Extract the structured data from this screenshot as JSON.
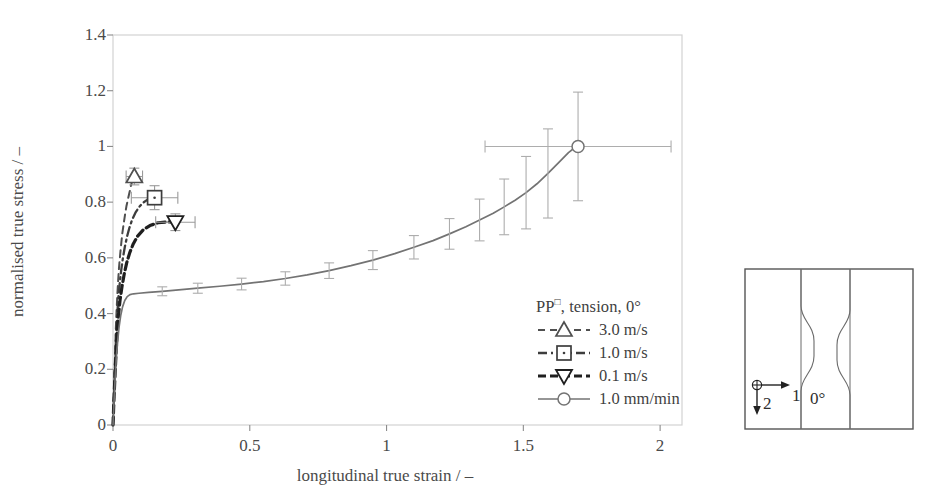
{
  "chart_data": {
    "type": "line",
    "title": "",
    "xlabel": "longitudinal true strain / –",
    "ylabel": "normalised true stress / –",
    "xlim": [
      0,
      2.08
    ],
    "ylim": [
      0,
      1.4
    ],
    "xticks": [
      "0",
      "0.5",
      "1",
      "1.5",
      "2"
    ],
    "xtick_values": [
      0,
      0.5,
      1,
      1.5,
      2
    ],
    "yticks": [
      "0",
      "0.2",
      "0.4",
      "0.6",
      "0.8",
      "1",
      "1.2",
      "1.4"
    ],
    "ytick_values": [
      0,
      0.2,
      0.4,
      0.6,
      0.8,
      1.0,
      1.2,
      1.4
    ],
    "grid": false,
    "legend_position": "inside-lower-right",
    "legend_title": "PP□, tension, 0°",
    "series": [
      {
        "name": "3.0 m/s",
        "marker": "triangle-up",
        "linestyle": "dashed",
        "color": "#4f4f4f",
        "points": [
          [
            0.0,
            0.0
          ],
          [
            0.003,
            0.09
          ],
          [
            0.005,
            0.175
          ],
          [
            0.008,
            0.265
          ],
          [
            0.01,
            0.34
          ],
          [
            0.013,
            0.41
          ],
          [
            0.016,
            0.47
          ],
          [
            0.019,
            0.52
          ],
          [
            0.022,
            0.565
          ],
          [
            0.026,
            0.61
          ],
          [
            0.03,
            0.65
          ],
          [
            0.034,
            0.688
          ],
          [
            0.039,
            0.722
          ],
          [
            0.044,
            0.755
          ],
          [
            0.049,
            0.785
          ],
          [
            0.055,
            0.812
          ],
          [
            0.061,
            0.838
          ],
          [
            0.066,
            0.86
          ],
          [
            0.07,
            0.876
          ],
          [
            0.074,
            0.886
          ],
          [
            0.078,
            0.892
          ]
        ],
        "end_marker": [
          0.078,
          0.892
        ],
        "end_xerr": 0.03,
        "end_yerr": 0.03
      },
      {
        "name": "1.0 m/s",
        "marker": "square",
        "linestyle": "dashdot",
        "color": "#3d3d3d",
        "points": [
          [
            0.0,
            0.0
          ],
          [
            0.003,
            0.085
          ],
          [
            0.006,
            0.175
          ],
          [
            0.009,
            0.262
          ],
          [
            0.012,
            0.338
          ],
          [
            0.016,
            0.405
          ],
          [
            0.02,
            0.462
          ],
          [
            0.025,
            0.512
          ],
          [
            0.03,
            0.556
          ],
          [
            0.036,
            0.598
          ],
          [
            0.043,
            0.638
          ],
          [
            0.051,
            0.675
          ],
          [
            0.06,
            0.708
          ],
          [
            0.07,
            0.737
          ],
          [
            0.082,
            0.762
          ],
          [
            0.095,
            0.782
          ],
          [
            0.11,
            0.798
          ],
          [
            0.125,
            0.808
          ],
          [
            0.14,
            0.814
          ],
          [
            0.152,
            0.816
          ]
        ],
        "end_marker": [
          0.152,
          0.816
        ],
        "end_xerr": 0.085,
        "end_yerr": 0.043
      },
      {
        "name": "0.1 m/s",
        "marker": "triangle-down",
        "linestyle": "dashed-bold",
        "color": "#1f1f1f",
        "points": [
          [
            0.0,
            0.0
          ],
          [
            0.003,
            0.08
          ],
          [
            0.007,
            0.17
          ],
          [
            0.011,
            0.256
          ],
          [
            0.015,
            0.33
          ],
          [
            0.02,
            0.394
          ],
          [
            0.026,
            0.45
          ],
          [
            0.033,
            0.498
          ],
          [
            0.041,
            0.542
          ],
          [
            0.05,
            0.582
          ],
          [
            0.061,
            0.618
          ],
          [
            0.074,
            0.65
          ],
          [
            0.09,
            0.678
          ],
          [
            0.11,
            0.7
          ],
          [
            0.135,
            0.716
          ],
          [
            0.165,
            0.726
          ],
          [
            0.2,
            0.729
          ],
          [
            0.228,
            0.728
          ]
        ],
        "end_marker": [
          0.228,
          0.728
        ],
        "end_xerr": 0.072,
        "end_yerr": 0.03
      },
      {
        "name": "1.0 mm/min",
        "marker": "circle",
        "linestyle": "solid",
        "color": "#737373",
        "points": [
          [
            0.0,
            0.0
          ],
          [
            0.004,
            0.09
          ],
          [
            0.008,
            0.17
          ],
          [
            0.012,
            0.24
          ],
          [
            0.017,
            0.3
          ],
          [
            0.022,
            0.35
          ],
          [
            0.028,
            0.392
          ],
          [
            0.035,
            0.424
          ],
          [
            0.043,
            0.447
          ],
          [
            0.052,
            0.461
          ],
          [
            0.062,
            0.468
          ],
          [
            0.075,
            0.471
          ],
          [
            0.095,
            0.473
          ],
          [
            0.13,
            0.476
          ],
          [
            0.18,
            0.48
          ],
          [
            0.24,
            0.485
          ],
          [
            0.31,
            0.491
          ],
          [
            0.39,
            0.498
          ],
          [
            0.47,
            0.506
          ],
          [
            0.55,
            0.515
          ],
          [
            0.63,
            0.526
          ],
          [
            0.71,
            0.539
          ],
          [
            0.79,
            0.554
          ],
          [
            0.87,
            0.572
          ],
          [
            0.95,
            0.592
          ],
          [
            1.03,
            0.615
          ],
          [
            1.1,
            0.638
          ],
          [
            1.17,
            0.662
          ],
          [
            1.23,
            0.686
          ],
          [
            1.29,
            0.712
          ],
          [
            1.34,
            0.736
          ],
          [
            1.39,
            0.76
          ],
          [
            1.43,
            0.783
          ],
          [
            1.47,
            0.807
          ],
          [
            1.51,
            0.834
          ],
          [
            1.55,
            0.866
          ],
          [
            1.59,
            0.903
          ],
          [
            1.63,
            0.943
          ],
          [
            1.665,
            0.978
          ],
          [
            1.69,
            0.997
          ],
          [
            1.7,
            1.0
          ]
        ],
        "errorbars": [
          {
            "x": 0.18,
            "y": 0.48,
            "yerr": 0.016,
            "xerr": 0.0
          },
          {
            "x": 0.31,
            "y": 0.491,
            "yerr": 0.018,
            "xerr": 0.0
          },
          {
            "x": 0.47,
            "y": 0.506,
            "yerr": 0.021,
            "xerr": 0.0
          },
          {
            "x": 0.63,
            "y": 0.526,
            "yerr": 0.024,
            "xerr": 0.0
          },
          {
            "x": 0.79,
            "y": 0.554,
            "yerr": 0.028,
            "xerr": 0.0
          },
          {
            "x": 0.95,
            "y": 0.592,
            "yerr": 0.034,
            "xerr": 0.0
          },
          {
            "x": 1.1,
            "y": 0.638,
            "yerr": 0.042,
            "xerr": 0.0
          },
          {
            "x": 1.23,
            "y": 0.686,
            "yerr": 0.055,
            "xerr": 0.0
          },
          {
            "x": 1.34,
            "y": 0.736,
            "yerr": 0.075,
            "xerr": 0.0
          },
          {
            "x": 1.43,
            "y": 0.783,
            "yerr": 0.1,
            "xerr": 0.0
          },
          {
            "x": 1.51,
            "y": 0.834,
            "yerr": 0.13,
            "xerr": 0.0
          },
          {
            "x": 1.59,
            "y": 0.903,
            "yerr": 0.16,
            "xerr": 0.0
          },
          {
            "x": 1.7,
            "y": 1.0,
            "yerr": 0.195,
            "xerr": 0.34
          }
        ],
        "end_marker": [
          1.7,
          1.0
        ]
      }
    ]
  },
  "axes": {
    "y_title": "normalised true stress / –",
    "x_title": "longitudinal true strain / –"
  },
  "legend": {
    "title_main": "PP",
    "title_sup": "□",
    "title_rest": ", tension, 0°",
    "entries": [
      {
        "label": "3.0 m/s",
        "marker": "triangle-up",
        "style": "dashed"
      },
      {
        "label": "1.0 m/s",
        "marker": "square",
        "style": "dashdot"
      },
      {
        "label": "0.1 m/s",
        "marker": "triangle-down",
        "style": "dashed-bold"
      },
      {
        "label": "1.0 mm/min",
        "marker": "circle",
        "style": "solid"
      }
    ]
  },
  "inset": {
    "name": "tensile-specimen-diagram",
    "angle_label": "0°",
    "axis_1_label": "1",
    "axis_2_label": "2"
  }
}
